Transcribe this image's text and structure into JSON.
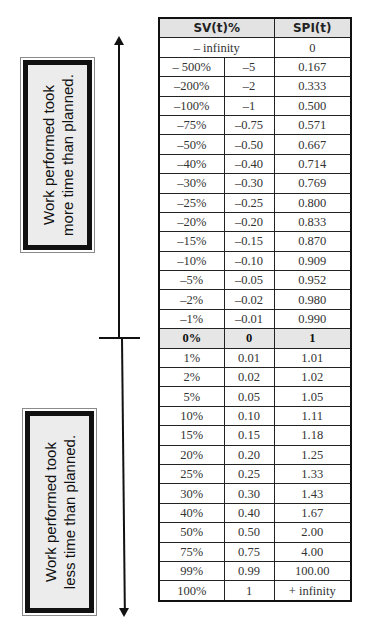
{
  "labels": {
    "top_box": {
      "line1": "Work performed took",
      "line2": "more time than planned."
    },
    "bottom_box": {
      "line1": "Work performed took",
      "line2": "less time than planned."
    }
  },
  "table": {
    "headers": {
      "sv_pct": "SV(t)%",
      "spi": "SPI(t)"
    },
    "rows": [
      {
        "pct": "– infinity",
        "ratio": "",
        "spi": "0",
        "merged": true
      },
      {
        "pct": "– 500%",
        "ratio": "–5",
        "spi": "0.167"
      },
      {
        "pct": "–200%",
        "ratio": "–2",
        "spi": "0.333"
      },
      {
        "pct": "–100%",
        "ratio": "–1",
        "spi": "0.500"
      },
      {
        "pct": "–75%",
        "ratio": "–0.75",
        "spi": "0.571"
      },
      {
        "pct": "–50%",
        "ratio": "–0.50",
        "spi": "0.667"
      },
      {
        "pct": "–40%",
        "ratio": "–0.40",
        "spi": "0.714"
      },
      {
        "pct": "–30%",
        "ratio": "–0.30",
        "spi": "0.769"
      },
      {
        "pct": "–25%",
        "ratio": "–0.25",
        "spi": "0.800"
      },
      {
        "pct": "–20%",
        "ratio": "–0.20",
        "spi": "0.833"
      },
      {
        "pct": "–15%",
        "ratio": "–0.15",
        "spi": "0.870"
      },
      {
        "pct": "–10%",
        "ratio": "–0.10",
        "spi": "0.909"
      },
      {
        "pct": "–5%",
        "ratio": "–0.05",
        "spi": "0.952"
      },
      {
        "pct": "–2%",
        "ratio": "–0.02",
        "spi": "0.980"
      },
      {
        "pct": "–1%",
        "ratio": "–0.01",
        "spi": "0.990"
      },
      {
        "pct": "0%",
        "ratio": "0",
        "spi": "1",
        "highlight": true
      },
      {
        "pct": "1%",
        "ratio": "0.01",
        "spi": "1.01"
      },
      {
        "pct": "2%",
        "ratio": "0.02",
        "spi": "1.02"
      },
      {
        "pct": "5%",
        "ratio": "0.05",
        "spi": "1.05"
      },
      {
        "pct": "10%",
        "ratio": "0.10",
        "spi": "1.11"
      },
      {
        "pct": "15%",
        "ratio": "0.15",
        "spi": "1.18"
      },
      {
        "pct": "20%",
        "ratio": "0.20",
        "spi": "1.25"
      },
      {
        "pct": "25%",
        "ratio": "0.25",
        "spi": "1.33"
      },
      {
        "pct": "30%",
        "ratio": "0.30",
        "spi": "1.43"
      },
      {
        "pct": "40%",
        "ratio": "0.40",
        "spi": "1.67"
      },
      {
        "pct": "50%",
        "ratio": "0.50",
        "spi": "2.00"
      },
      {
        "pct": "75%",
        "ratio": "0.75",
        "spi": "4.00"
      },
      {
        "pct": "99%",
        "ratio": "0.99",
        "spi": "100.00"
      },
      {
        "pct": "100%",
        "ratio": "1",
        "spi": "+ infinity"
      }
    ]
  },
  "arrows": {
    "up_icon": "arrow-up",
    "down_icon": "arrow-down",
    "zero_marker": "crossbar"
  }
}
